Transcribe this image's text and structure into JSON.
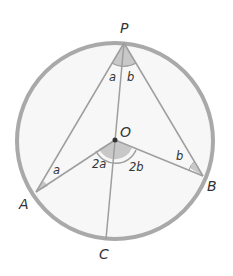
{
  "diagram": {
    "colors": {
      "circle_stroke": "#a9a9a9",
      "circle_fill": "#f7f7f7",
      "line": "#9e9e9e",
      "angle_fill": "#c8c8c8",
      "text": "#333333",
      "center_dot": "#333333"
    },
    "circle": {
      "cx": 115,
      "cy": 141,
      "r": 98
    },
    "points": {
      "P": {
        "label": "P",
        "x": 124,
        "y": 43,
        "lx": 120,
        "ly": 33
      },
      "O": {
        "label": "O",
        "x": 115,
        "y": 140,
        "lx": 120,
        "ly": 137
      },
      "A": {
        "label": "A",
        "x": 36,
        "y": 192,
        "lx": 19,
        "ly": 209
      },
      "B": {
        "label": "B",
        "x": 203,
        "y": 176,
        "lx": 207,
        "ly": 191
      },
      "C": {
        "label": "C",
        "x": 106,
        "y": 239,
        "lx": 99,
        "ly": 259
      }
    },
    "angle_labels": {
      "P_left": "a",
      "P_right": "b",
      "A": "a",
      "B": "b",
      "O_left": "2a",
      "O_right": "2b"
    }
  }
}
